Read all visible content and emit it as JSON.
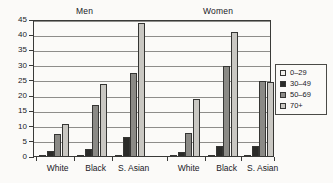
{
  "chart_data": {
    "type": "bar",
    "title": "",
    "xlabel": "",
    "ylabel": "",
    "ylim": [
      0,
      45
    ],
    "yticks": [
      0,
      5,
      10,
      15,
      20,
      25,
      30,
      35,
      40,
      45
    ],
    "grid": true,
    "legend_position": "right",
    "panel_titles": [
      "Men",
      "Women"
    ],
    "categories": [
      "White",
      "Black",
      "S. Asian",
      "White",
      "Black",
      "S. Asian"
    ],
    "series": [
      {
        "name": "0–29",
        "color": "#f2f0ec",
        "values": [
          0.5,
          0.3,
          0.3,
          0.3,
          0.3,
          0.3
        ]
      },
      {
        "name": "30–49",
        "color": "#2b2b29",
        "values": [
          2.0,
          2.5,
          6.5,
          1.5,
          3.5,
          3.5
        ]
      },
      {
        "name": "50–69",
        "color": "#8b8a86",
        "values": [
          7.5,
          17.0,
          27.5,
          8.0,
          30.0,
          25.0
        ]
      },
      {
        "name": "70+",
        "color": "#c9c7c2",
        "values": [
          11.0,
          24.0,
          44.0,
          19.0,
          41.0,
          24.5
        ]
      }
    ],
    "groups": [
      {
        "panel": "Men",
        "bars": [
          {
            "category": "White",
            "values": [
              0.5,
              2.0,
              7.5,
              11.0
            ]
          },
          {
            "category": "Black",
            "values": [
              0.3,
              2.5,
              17.0,
              24.0
            ]
          },
          {
            "category": "S. Asian",
            "values": [
              0.3,
              6.5,
              27.5,
              44.0
            ]
          }
        ]
      },
      {
        "panel": "Women",
        "bars": [
          {
            "category": "White",
            "values": [
              0.3,
              1.5,
              8.0,
              19.0
            ]
          },
          {
            "category": "Black",
            "values": [
              0.3,
              3.5,
              30.0,
              41.0
            ]
          },
          {
            "category": "S. Asian",
            "values": [
              0.3,
              3.5,
              25.0,
              24.5
            ]
          }
        ]
      }
    ]
  },
  "panels": {
    "men": "Men",
    "women": "Women"
  },
  "axis": {
    "y_labels": [
      "45",
      "40",
      "35",
      "30",
      "25",
      "20",
      "15",
      "10",
      "5",
      "0"
    ],
    "x_labels": [
      "White",
      "Black",
      "S. Asian",
      "White",
      "Black",
      "S. Asian"
    ]
  },
  "legend": {
    "items": [
      {
        "label": "0–29",
        "color": "#f2f0ec"
      },
      {
        "label": "30–49",
        "color": "#2b2b29"
      },
      {
        "label": "50–69",
        "color": "#8b8a86"
      },
      {
        "label": "70+",
        "color": "#c9c7c2"
      }
    ]
  }
}
